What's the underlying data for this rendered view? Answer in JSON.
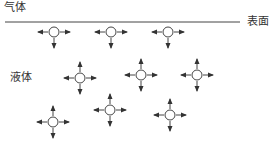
{
  "labels": {
    "gas": "气体",
    "surface": "表面",
    "liquid": "液体"
  },
  "colors": {
    "stroke": "#444444",
    "text": "#333333",
    "background": "#ffffff"
  },
  "surface_line": {
    "x1": 5,
    "x2": 240,
    "y": 22
  },
  "molecules": [
    {
      "x": 54,
      "y": 32,
      "arrows": [
        "left",
        "right",
        "down"
      ],
      "region": "surface"
    },
    {
      "x": 111,
      "y": 32,
      "arrows": [
        "left",
        "right",
        "down"
      ],
      "region": "surface"
    },
    {
      "x": 168,
      "y": 32,
      "arrows": [
        "left",
        "right",
        "down"
      ],
      "region": "surface"
    },
    {
      "x": 80,
      "y": 78,
      "arrows": [
        "up",
        "down",
        "left",
        "right"
      ],
      "region": "bulk"
    },
    {
      "x": 141,
      "y": 75,
      "arrows": [
        "up",
        "down",
        "left",
        "right"
      ],
      "region": "bulk"
    },
    {
      "x": 197,
      "y": 75,
      "arrows": [
        "up",
        "down",
        "left",
        "right"
      ],
      "region": "bulk"
    },
    {
      "x": 53,
      "y": 122,
      "arrows": [
        "up",
        "down",
        "left",
        "right"
      ],
      "region": "bulk"
    },
    {
      "x": 110,
      "y": 110,
      "arrows": [
        "up",
        "down",
        "left",
        "right"
      ],
      "region": "bulk"
    },
    {
      "x": 170,
      "y": 115,
      "arrows": [
        "up",
        "down",
        "left",
        "right"
      ],
      "region": "bulk"
    }
  ]
}
